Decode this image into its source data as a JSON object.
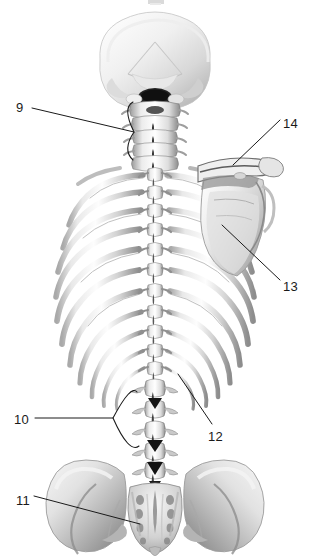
{
  "figure": {
    "background_color": "#ffffff",
    "ink_color": "#1a1a1a",
    "width": 311,
    "height": 556
  },
  "labels": [
    {
      "id": "9",
      "text": "9",
      "x": 16,
      "y": 112,
      "target_part": "cervical-vertebrae",
      "leader": "horizontal-to-bracket"
    },
    {
      "id": "14",
      "text": "14",
      "x": 283,
      "y": 128,
      "target_part": "spine-of-scapula",
      "leader": "diagonal-down-left"
    },
    {
      "id": "13",
      "text": "13",
      "x": 283,
      "y": 291,
      "target_part": "scapula-body",
      "leader": "diagonal-up-left"
    },
    {
      "id": "10",
      "text": "10",
      "x": 14,
      "y": 424,
      "target_part": "lumbar-vertebrae",
      "leader": "horizontal-to-bracket"
    },
    {
      "id": "12",
      "text": "12",
      "x": 208,
      "y": 441,
      "target_part": "transverse-process",
      "leader": "diagonal-up-left"
    },
    {
      "id": "11",
      "text": "11",
      "x": 16,
      "y": 505,
      "target_part": "sacrum",
      "leader": "diagonal-down-right"
    }
  ],
  "anatomy_parts": [
    {
      "name": "occipital-skull",
      "region": "cranium"
    },
    {
      "name": "cervical-vertebrae",
      "region": "neck"
    },
    {
      "name": "thoracic-vertebrae",
      "region": "upper-back"
    },
    {
      "name": "rib-cage-left",
      "region": "thorax"
    },
    {
      "name": "rib-cage-right",
      "region": "thorax"
    },
    {
      "name": "scapula-right",
      "region": "shoulder-girdle"
    },
    {
      "name": "spine-of-scapula",
      "region": "shoulder-girdle"
    },
    {
      "name": "lumbar-vertebrae",
      "region": "lower-back"
    },
    {
      "name": "sacrum",
      "region": "pelvis"
    },
    {
      "name": "ilium-left",
      "region": "pelvis"
    },
    {
      "name": "ilium-right",
      "region": "pelvis"
    }
  ]
}
